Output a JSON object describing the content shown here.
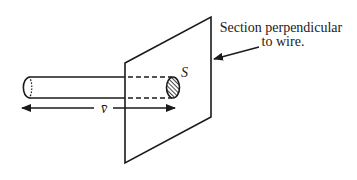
{
  "diagram": {
    "label": {
      "line1": "Section perpendicular",
      "line2": "to wire."
    },
    "cross_section_symbol": "S",
    "velocity_symbol": "v̄",
    "colors": {
      "stroke": "#1a1a1a",
      "background": "#ffffff"
    }
  }
}
